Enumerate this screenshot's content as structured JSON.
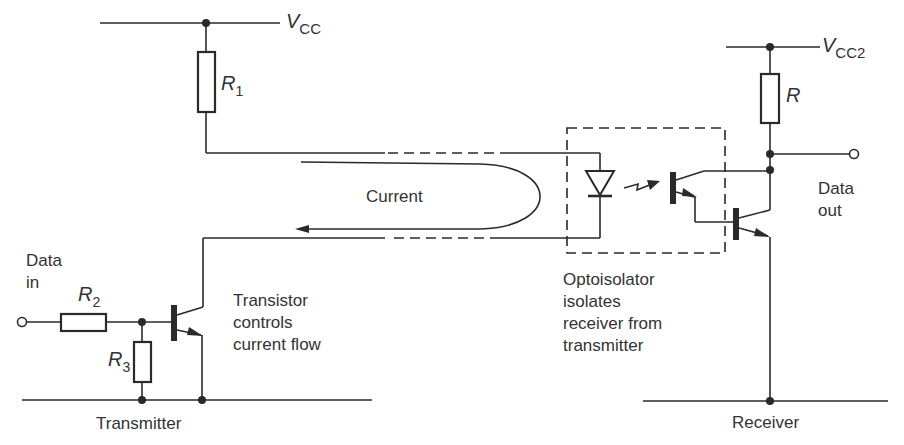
{
  "diagram": {
    "supply_labels": {
      "vcc": {
        "main": "V",
        "sub": "CC"
      },
      "vcc2": {
        "main": "V",
        "sub": "CC2"
      }
    },
    "components": {
      "r1": {
        "main": "R",
        "sub": "1"
      },
      "r2": {
        "main": "R",
        "sub": "2"
      },
      "r3": {
        "main": "R",
        "sub": "3"
      },
      "r": {
        "main": "R"
      }
    },
    "annotations": {
      "data_in": [
        "Data",
        "in"
      ],
      "data_out": [
        "Data",
        "out"
      ],
      "current": "Current",
      "transistor_note": [
        "Transistor",
        "controls",
        "current flow"
      ],
      "optoisolator_note": [
        "Optoisolator",
        "isolates",
        "receiver from",
        "transmitter"
      ],
      "transmitter": "Transmitter",
      "receiver": "Receiver"
    },
    "colors": {
      "ink": "#2a2a2a",
      "background": "#ffffff"
    }
  }
}
